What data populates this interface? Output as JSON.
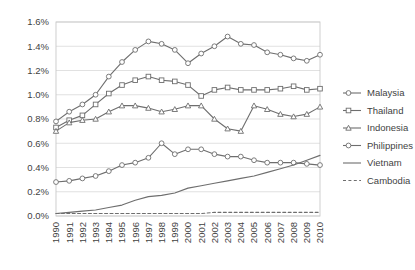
{
  "chart_data": {
    "type": "line",
    "title": "",
    "subtitle": "",
    "xlabel": "",
    "ylabel": "",
    "grid": "horizontal",
    "legend_position": "right",
    "ylim": [
      0.0,
      1.6
    ],
    "ytick_labels": [
      "0.0%",
      "0.2%",
      "0.4%",
      "0.6%",
      "0.8%",
      "1.0%",
      "1.2%",
      "1.4%",
      "1.6%"
    ],
    "ytick_values": [
      0.0,
      0.2,
      0.4,
      0.6,
      0.8,
      1.0,
      1.2,
      1.4,
      1.6
    ],
    "categories": [
      "1990",
      "1991",
      "1992",
      "1993",
      "1994",
      "1995",
      "1996",
      "1997",
      "1998",
      "1999",
      "2000",
      "2001",
      "2002",
      "2003",
      "2004",
      "2005",
      "2006",
      "2007",
      "2008",
      "2009",
      "2010"
    ],
    "x": [
      1990,
      1991,
      1992,
      1993,
      1994,
      1995,
      1996,
      1997,
      1998,
      1999,
      2000,
      2001,
      2002,
      2003,
      2004,
      2005,
      2006,
      2007,
      2008,
      2009,
      2010
    ],
    "series": [
      {
        "name": "Malaysia",
        "marker": "circle",
        "line_style": "solid",
        "color": "#6e6e6e",
        "values": [
          0.78,
          0.86,
          0.92,
          1.0,
          1.15,
          1.27,
          1.37,
          1.44,
          1.42,
          1.37,
          1.26,
          1.34,
          1.4,
          1.48,
          1.42,
          1.41,
          1.35,
          1.33,
          1.3,
          1.28,
          1.33
        ]
      },
      {
        "name": "Thailand",
        "marker": "square",
        "line_style": "solid",
        "color": "#6e6e6e",
        "values": [
          0.73,
          0.79,
          0.83,
          0.92,
          1.01,
          1.08,
          1.12,
          1.15,
          1.12,
          1.11,
          1.08,
          0.99,
          1.04,
          1.06,
          1.04,
          1.04,
          1.04,
          1.05,
          1.07,
          1.04,
          1.05
        ]
      },
      {
        "name": "Indonesia",
        "marker": "triangle",
        "line_style": "solid",
        "color": "#6e6e6e",
        "values": [
          0.7,
          0.77,
          0.79,
          0.8,
          0.86,
          0.91,
          0.91,
          0.89,
          0.86,
          0.88,
          0.91,
          0.91,
          0.8,
          0.72,
          0.7,
          0.91,
          0.88,
          0.84,
          0.82,
          0.84,
          0.9
        ]
      },
      {
        "name": "Philippines",
        "marker": "circle",
        "line_style": "solid",
        "color": "#6e6e6e",
        "values": [
          0.28,
          0.29,
          0.31,
          0.33,
          0.37,
          0.42,
          0.44,
          0.48,
          0.6,
          0.51,
          0.55,
          0.55,
          0.51,
          0.49,
          0.49,
          0.46,
          0.44,
          0.44,
          0.44,
          0.43,
          0.42
        ]
      },
      {
        "name": "Vietnam",
        "marker": "none",
        "line_style": "solid",
        "color": "#6e6e6e",
        "values": [
          0.02,
          0.03,
          0.04,
          0.05,
          0.07,
          0.09,
          0.13,
          0.16,
          0.17,
          0.19,
          0.23,
          0.25,
          0.27,
          0.29,
          0.31,
          0.33,
          0.36,
          0.39,
          0.42,
          0.46,
          0.5
        ]
      },
      {
        "name": "Cambodia",
        "marker": "none",
        "line_style": "dashed",
        "color": "#6e6e6e",
        "values": [
          0.02,
          0.02,
          0.02,
          0.02,
          0.02,
          0.02,
          0.02,
          0.02,
          0.02,
          0.02,
          0.02,
          0.02,
          0.03,
          0.03,
          0.03,
          0.03,
          0.03,
          0.03,
          0.03,
          0.03,
          0.03
        ]
      }
    ]
  },
  "legend": {
    "items": [
      {
        "label": "Malaysia"
      },
      {
        "label": "Thailand"
      },
      {
        "label": "Indonesia"
      },
      {
        "label": "Philippines"
      },
      {
        "label": "Vietnam"
      },
      {
        "label": "Cambodia"
      }
    ]
  }
}
